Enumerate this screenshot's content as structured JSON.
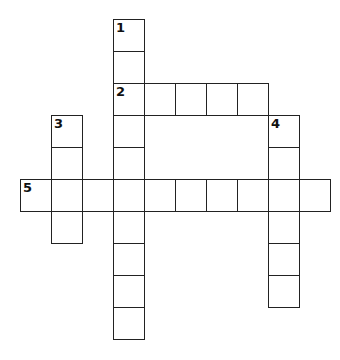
{
  "puzzle": {
    "type": "crossword",
    "grid": {
      "origin_x": 20,
      "origin_y": 19,
      "cell_w": 31,
      "cell_h": 32
    },
    "words": [
      {
        "number": "1",
        "direction": "down",
        "row": 0,
        "col": 3,
        "length": 10
      },
      {
        "number": "2",
        "direction": "across",
        "row": 2,
        "col": 3,
        "length": 5
      },
      {
        "number": "3",
        "direction": "down",
        "row": 3,
        "col": 1,
        "length": 4
      },
      {
        "number": "4",
        "direction": "down",
        "row": 3,
        "col": 8,
        "length": 6
      },
      {
        "number": "5",
        "direction": "across",
        "row": 5,
        "col": 0,
        "length": 10
      }
    ]
  }
}
